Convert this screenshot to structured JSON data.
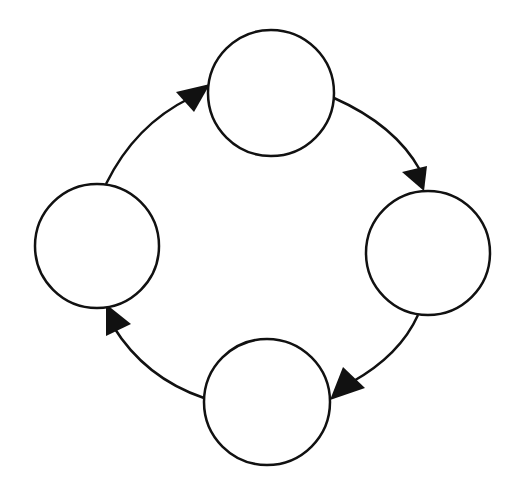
{
  "diagram": {
    "type": "cycle",
    "background": "#ffffff",
    "stroke_color": "#111111",
    "nodes": [
      {
        "id": "top",
        "label": "",
        "cx": 271,
        "cy": 93,
        "r": 63
      },
      {
        "id": "right",
        "label": "",
        "cx": 428,
        "cy": 253,
        "r": 62
      },
      {
        "id": "bottom",
        "label": "",
        "cx": 267,
        "cy": 402,
        "r": 63
      },
      {
        "id": "left",
        "label": "",
        "cx": 97,
        "cy": 246,
        "r": 62
      }
    ],
    "edges": [
      {
        "from": "top",
        "to": "right",
        "direction": "clockwise"
      },
      {
        "from": "right",
        "to": "bottom",
        "direction": "clockwise"
      },
      {
        "from": "bottom",
        "to": "left",
        "direction": "clockwise"
      },
      {
        "from": "left",
        "to": "top",
        "direction": "clockwise"
      }
    ]
  }
}
